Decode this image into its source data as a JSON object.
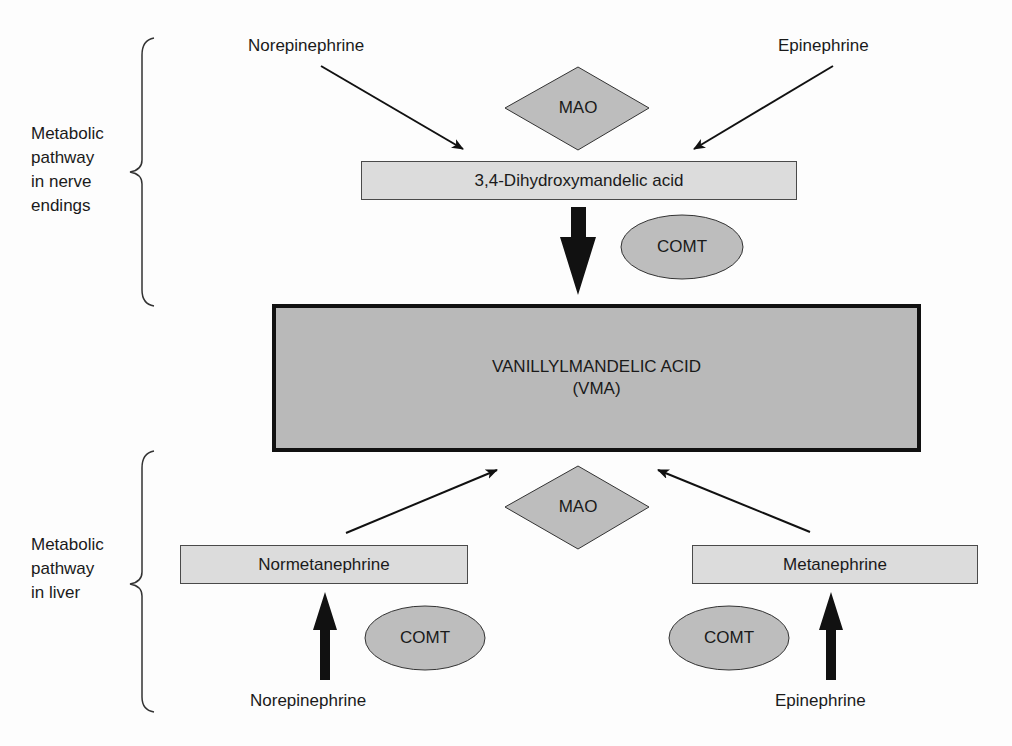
{
  "colors": {
    "product_fill": "#b9b9b9",
    "intermediate_fill": "#dcdcdc",
    "enzyme_fill": "#bdbdbd",
    "stroke": "#111111"
  },
  "nerve_section": {
    "label": "Metabolic\npathway\nin nerve\nendings",
    "label_lines": [
      "Metabolic",
      "pathway",
      "in nerve",
      "endings"
    ],
    "sources": {
      "left": "Norepinephrine",
      "right": "Epinephrine"
    },
    "enzyme_top": "MAO",
    "intermediate": "3,4-Dihydroxymandelic acid",
    "enzyme_down": "COMT"
  },
  "product": {
    "line1": "VANILLYLMANDELIC ACID",
    "line2": "(VMA)"
  },
  "liver_section": {
    "label_lines": [
      "Metabolic",
      "pathway",
      "in liver"
    ],
    "enzyme_top": "MAO",
    "left": {
      "intermediate": "Normetanephrine",
      "enzyme": "COMT",
      "source": "Norepinephrine"
    },
    "right": {
      "intermediate": "Metanephrine",
      "enzyme": "COMT",
      "source": "Epinephrine"
    }
  }
}
